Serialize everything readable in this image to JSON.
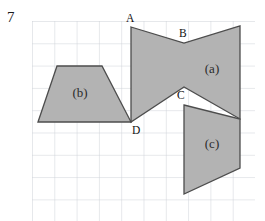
{
  "figure": {
    "question_number": "7",
    "canvas": {
      "width": 265,
      "height": 221,
      "background": "#ffffff"
    },
    "grid": {
      "visible": true,
      "line_color": "#c9cdd4",
      "spacing_px": 22.3,
      "origin_x": 32,
      "origin_y": 21,
      "columns": 10,
      "rows": 9
    },
    "style": {
      "fill_color": "#b3b3b3",
      "stroke_color": "#4d4d4d",
      "stroke_width": 1.3
    },
    "shapes": [
      {
        "id": "shape-a",
        "label": "(a)",
        "label_x": 212,
        "label_y": 68,
        "type": "polygon",
        "points": "131,27 184,43 240,26 240,119 184,87 131,122"
      },
      {
        "id": "shape-b",
        "label": "(b)",
        "label_x": 80,
        "label_y": 92,
        "type": "polygon",
        "points": "38,122 57,66 102,66 131,122"
      },
      {
        "id": "shape-c",
        "label": "(c)",
        "label_x": 212,
        "label_y": 143,
        "type": "polygon",
        "points": "184,105 240,119 240,168 184,194"
      }
    ],
    "vertex_labels": [
      {
        "id": "label-A",
        "text": "A",
        "x": 126,
        "y": 13
      },
      {
        "id": "label-B",
        "text": "B",
        "x": 179,
        "y": 28
      },
      {
        "id": "label-C",
        "text": "C",
        "x": 177,
        "y": 90
      },
      {
        "id": "label-D",
        "text": "D",
        "x": 132,
        "y": 125
      }
    ]
  }
}
